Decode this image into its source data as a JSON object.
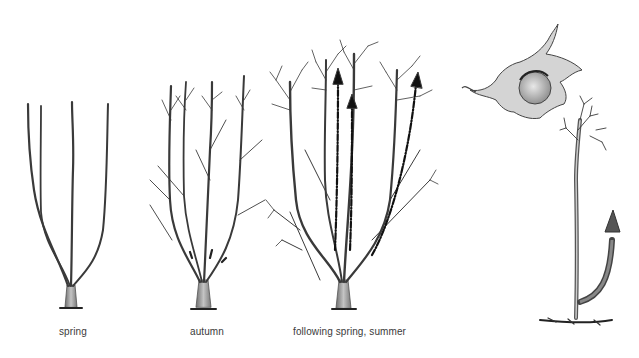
{
  "figure": {
    "panels": [
      {
        "id": "spring",
        "caption": "spring"
      },
      {
        "id": "autumn",
        "caption": "autumn"
      },
      {
        "id": "following",
        "caption": "following spring, summer"
      },
      {
        "id": "sucker",
        "caption": ""
      }
    ],
    "icons": [
      "hazelnut-icon",
      "growth-arrow-icon"
    ],
    "colors": {
      "ink": "#2b2b2b",
      "bark": "#8c8c8c",
      "bark_light": "#bdbdbd",
      "background": "#ffffff"
    }
  }
}
